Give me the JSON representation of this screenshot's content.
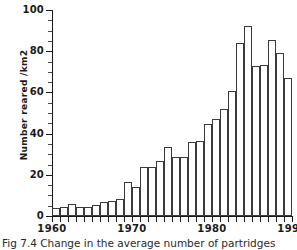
{
  "caption": "Fig 7.4 Change in the average number of partridges",
  "axis": {
    "y_title": "Number reared /km2",
    "y_ticks": [
      0,
      20,
      40,
      60,
      80,
      100
    ],
    "x_ticks": [
      1960,
      1970,
      1980,
      1990
    ]
  },
  "colors": {
    "axis": "#1a1a1a",
    "bar_outline": "#3a3a3a",
    "bar_fill": "#ffffff",
    "background": "#ffffff"
  },
  "chart_data": {
    "type": "bar",
    "title": "Fig 7.4 Change in the average number of partridges",
    "xlabel": "",
    "ylabel": "Number reared /km2",
    "xlim": [
      1960,
      1990
    ],
    "ylim": [
      0,
      100
    ],
    "grid": false,
    "legend": "none",
    "categories": [
      "1960",
      "1961",
      "1962",
      "1963",
      "1964",
      "1965",
      "1966",
      "1967",
      "1968",
      "1969",
      "1970",
      "1971",
      "1972",
      "1973",
      "1974",
      "1975",
      "1976",
      "1977",
      "1978",
      "1979",
      "1980",
      "1981",
      "1982",
      "1983",
      "1984",
      "1985",
      "1986",
      "1987",
      "1988",
      "1989"
    ],
    "values": [
      4,
      4.5,
      6,
      4.5,
      4.5,
      5.5,
      7,
      7.5,
      8.5,
      16.5,
      14,
      24,
      24,
      26.5,
      33.5,
      28.5,
      28.5,
      36,
      36.5,
      44.5,
      47,
      52,
      60.5,
      84,
      92,
      73,
      73.5,
      85.5,
      79,
      67
    ]
  }
}
